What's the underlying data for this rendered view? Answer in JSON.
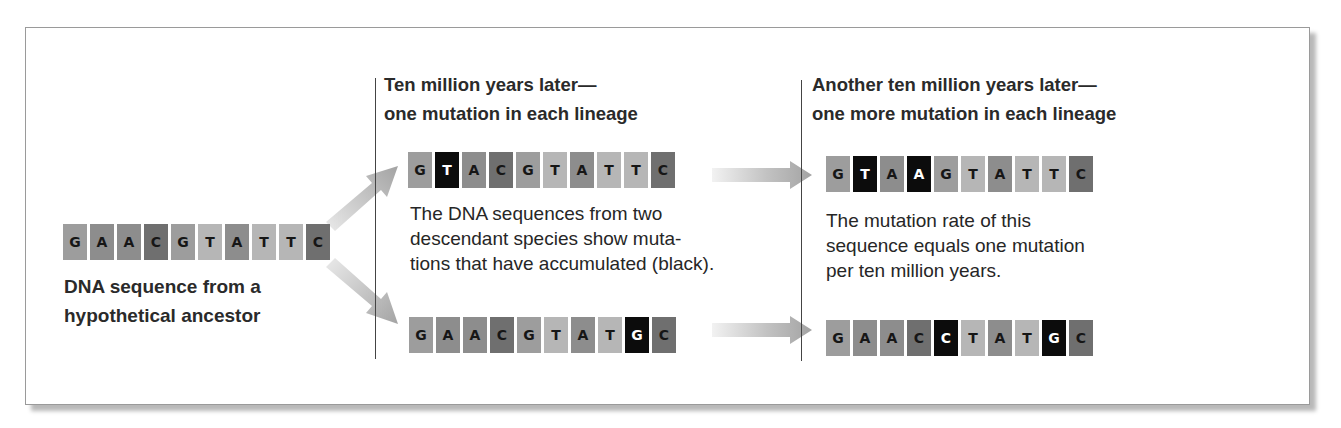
{
  "figure": {
    "ancestor": {
      "sequence": [
        "G",
        "A",
        "A",
        "C",
        "G",
        "T",
        "A",
        "T",
        "T",
        "C"
      ],
      "mutations": [],
      "caption_lines": [
        "DNA sequence from a",
        "hypothetical ancestor"
      ]
    },
    "stage1": {
      "heading_lines": [
        "Ten million years later—",
        "one mutation in each lineage"
      ],
      "top_sequence": [
        "G",
        "T",
        "A",
        "C",
        "G",
        "T",
        "A",
        "T",
        "T",
        "C"
      ],
      "top_mutations": [
        1
      ],
      "bottom_sequence": [
        "G",
        "A",
        "A",
        "C",
        "G",
        "T",
        "A",
        "T",
        "G",
        "C"
      ],
      "bottom_mutations": [
        8
      ],
      "body_lines": [
        "The DNA sequences from two",
        "descendant species show muta-",
        "tions that have accumulated (black)."
      ]
    },
    "stage2": {
      "heading_lines": [
        "Another ten million years later—",
        "one more mutation in each lineage"
      ],
      "top_sequence": [
        "G",
        "T",
        "A",
        "A",
        "G",
        "T",
        "A",
        "T",
        "T",
        "C"
      ],
      "top_mutations": [
        1,
        3
      ],
      "bottom_sequence": [
        "G",
        "A",
        "A",
        "C",
        "C",
        "T",
        "A",
        "T",
        "G",
        "C"
      ],
      "bottom_mutations": [
        4,
        8
      ],
      "body_lines": [
        "The mutation rate of this",
        "sequence equals one mutation",
        "per ten million years."
      ]
    },
    "colors": {
      "G": "#9d9d9d",
      "A": "#8d8d8d",
      "C": "#6f6f6f",
      "T": "#b6b6b6",
      "mutation": "#0c0c0c",
      "arrow": "#a6a6a6"
    },
    "icons": {
      "branch_arrow_up": "diagonal-arrow-up-right-icon",
      "branch_arrow_down": "diagonal-arrow-down-right-icon",
      "time_arrow": "arrow-right-icon"
    }
  }
}
